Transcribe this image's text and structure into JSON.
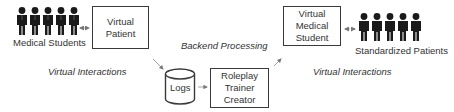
{
  "diagram": {
    "left_group": {
      "people_label": "Medical Students",
      "people_count": 5,
      "box_label_lines": [
        "Virtual",
        "Patient"
      ],
      "caption": "Virtual Interactions"
    },
    "backend": {
      "caption": "Backend Processing",
      "logs_label": "Logs",
      "creator_label_lines": [
        "Roleplay",
        "Trainer",
        "Creator"
      ]
    },
    "right_group": {
      "box_label_lines": [
        "Virtual",
        "Medical",
        "Student"
      ],
      "people_label": "Standardized Patients",
      "people_count": 5,
      "caption": "Virtual Interactions"
    },
    "edges": [
      {
        "from": "Medical Students",
        "to": "Virtual Patient",
        "style": "dotted-double-arrow"
      },
      {
        "from": "Virtual Patient",
        "to": "Logs",
        "style": "arrow"
      },
      {
        "from": "Logs",
        "to": "Roleplay Trainer Creator",
        "style": "arrow"
      },
      {
        "from": "Roleplay Trainer Creator",
        "to": "Virtual Medical Student",
        "style": "arrow"
      },
      {
        "from": "Virtual Medical Student",
        "to": "Standardized Patients",
        "style": "dotted-double-arrow"
      }
    ],
    "colors": {
      "figure": "#1a1a1a",
      "box_border": "#3a3a3a",
      "arrow": "#8a8a8a",
      "text": "#333333"
    }
  }
}
